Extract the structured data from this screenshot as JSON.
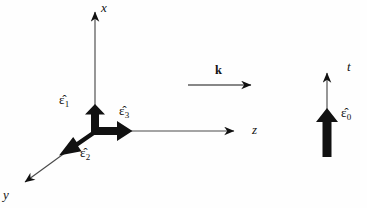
{
  "figure": {
    "background_color": "#fefefe",
    "ink_color": "#111111",
    "thin_axis_color": "#4a4a4a",
    "width": 367,
    "height": 208
  },
  "axes": [
    {
      "name": "x-axis",
      "label": "x",
      "direction": "up",
      "from": [
        95,
        131
      ],
      "to": [
        95,
        6
      ]
    },
    {
      "name": "y-axis",
      "label": "y",
      "direction": "down-left",
      "from": [
        95,
        131
      ],
      "to": [
        20,
        186
      ]
    },
    {
      "name": "z-axis",
      "label": "z",
      "direction": "right",
      "from": [
        95,
        131
      ],
      "to": [
        241,
        131
      ]
    },
    {
      "name": "t-axis",
      "label": "t",
      "direction": "up",
      "from": [
        327,
        156
      ],
      "to": [
        327,
        66
      ]
    }
  ],
  "basis_vectors": [
    {
      "name": "epsilon-1",
      "label": "ε̂",
      "subscript": "1",
      "direction": "up",
      "from": [
        95,
        131
      ],
      "to": [
        95,
        107
      ]
    },
    {
      "name": "epsilon-2",
      "label": "ε̂",
      "subscript": "2",
      "direction": "down-left",
      "from": [
        95,
        131
      ],
      "to": [
        61,
        154
      ]
    },
    {
      "name": "epsilon-3",
      "label": "ε̂",
      "subscript": "3",
      "direction": "right",
      "from": [
        95,
        131
      ],
      "to": [
        131,
        131
      ]
    },
    {
      "name": "epsilon-0",
      "label": "ε̂",
      "subscript": "0",
      "direction": "up",
      "from": [
        327,
        156
      ],
      "to": [
        327,
        109
      ]
    }
  ],
  "wave_vector": {
    "name": "k-vector",
    "label": "k",
    "bold": true,
    "from": [
      188,
      85
    ],
    "to": [
      258,
      85
    ]
  }
}
